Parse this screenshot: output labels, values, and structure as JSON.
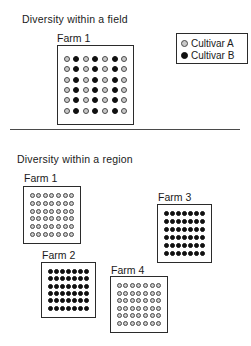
{
  "field": {
    "title": "Diversity within a field",
    "farm": {
      "label": "Farm 1",
      "grid": {
        "rows": 6,
        "cols": 7,
        "column_types": [
          "A",
          "B",
          "A",
          "B",
          "A",
          "B",
          "A"
        ]
      }
    }
  },
  "legend": {
    "items": [
      {
        "icon": "cultivar-a-dot",
        "label": "Cultivar A",
        "cultivar": "A"
      },
      {
        "icon": "cultivar-b-dot",
        "label": "Cultivar B",
        "cultivar": "B"
      }
    ]
  },
  "region": {
    "title": "Diversity within a region",
    "farms": [
      {
        "label": "Farm 1",
        "grid": {
          "rows": 6,
          "cols": 7,
          "type": "A"
        }
      },
      {
        "label": "Farm 3",
        "grid": {
          "rows": 6,
          "cols": 7,
          "type": "B"
        }
      },
      {
        "label": "Farm 2",
        "grid": {
          "rows": 6,
          "cols": 7,
          "type": "B"
        }
      },
      {
        "label": "Farm 4",
        "grid": {
          "rows": 6,
          "cols": 7,
          "type": "A"
        }
      }
    ]
  },
  "colors": {
    "cultivar_a_fill": "#c9c9c9",
    "cultivar_a_ring": "#4a4a4a",
    "cultivar_b": "#101010",
    "box_border": "#2b2b2b",
    "text": "#1a1a1a",
    "background": "#ffffff"
  }
}
